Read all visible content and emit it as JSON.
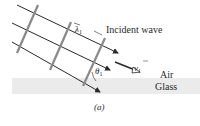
{
  "figure": {
    "caption": "(a)",
    "incident_label": "Incident wave",
    "medium_top": "Air",
    "medium_bottom": "Glass",
    "wavelength_symbol": "λ",
    "wavelength_subscript": "1",
    "angle_symbol": "θ",
    "angle_subscript": "1",
    "velocity_symbol": "v",
    "velocity_subscript": "1"
  },
  "colors": {
    "ray": "#2a2a2a",
    "wavefront": "#8a8a8a",
    "glass": "#ebebeb",
    "text": "#2a2a2a"
  }
}
